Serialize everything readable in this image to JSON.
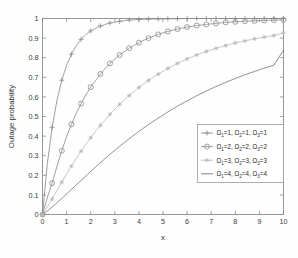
{
  "chart_data": {
    "type": "line",
    "title": "",
    "xlabel": "x",
    "ylabel": "Outage probability",
    "xlim": [
      0,
      10
    ],
    "ylim": [
      0,
      1
    ],
    "xticks": [
      "0",
      "1",
      "2",
      "3",
      "4",
      "5",
      "6",
      "7",
      "8",
      "9",
      "10"
    ],
    "yticks": [
      "0",
      "0.1",
      "0.2",
      "0.3",
      "0.4",
      "0.5",
      "0.6",
      "0.7",
      "0.8",
      "0.9",
      "1"
    ],
    "grid": false,
    "legend_position": "lower right",
    "x": [
      0,
      0.2,
      0.4,
      0.6,
      0.8,
      1.0,
      1.2,
      1.4,
      1.6,
      1.8,
      2.0,
      2.4,
      2.8,
      3.2,
      3.6,
      4.0,
      4.4,
      4.8,
      5.2,
      5.6,
      6.0,
      6.4,
      6.8,
      7.2,
      7.6,
      8.0,
      8.4,
      8.8,
      9.2,
      9.6,
      10.0
    ],
    "series": [
      {
        "name": "Ω₁=1, Ω₂=1, Ω₃=1",
        "omega1": 1,
        "omega2": 1,
        "omega3": 1,
        "marker": "plus",
        "color": "#8a8a8a",
        "marker_x": [
          0,
          0.4,
          0.8,
          1.2,
          1.6,
          2.0,
          2.4,
          2.8,
          3.2,
          3.6,
          4.0,
          4.4,
          4.8,
          5.2,
          5.6,
          6.0,
          6.4,
          6.8,
          7.2,
          7.6,
          8.0,
          8.4,
          8.8,
          9.2,
          9.6,
          10.0
        ],
        "values": [
          0.0,
          0.259,
          0.445,
          0.582,
          0.685,
          0.761,
          0.818,
          0.861,
          0.894,
          0.918,
          0.937,
          0.962,
          0.977,
          0.986,
          0.992,
          0.995,
          0.997,
          0.998,
          0.999,
          0.999,
          1.0,
          1.0,
          1.0,
          1.0,
          1.0,
          1.0,
          1.0,
          1.0,
          1.0,
          1.0,
          1.0
        ]
      },
      {
        "name": "Ω₁=2, Ω₂=2, Ω₃=2",
        "omega1": 2,
        "omega2": 2,
        "omega3": 2,
        "marker": "circle",
        "color": "#8a8a8a",
        "marker_x": [
          0,
          0.4,
          0.8,
          1.2,
          1.6,
          2.0,
          2.4,
          2.8,
          3.2,
          3.6,
          4.0,
          4.4,
          4.8,
          5.2,
          5.6,
          6.0,
          6.4,
          6.8,
          7.2,
          7.6,
          8.0,
          8.4,
          8.8,
          9.2,
          9.6,
          10.0
        ],
        "values": [
          0.0,
          0.086,
          0.16,
          0.245,
          0.325,
          0.398,
          0.46,
          0.516,
          0.566,
          0.61,
          0.65,
          0.717,
          0.771,
          0.814,
          0.849,
          0.877,
          0.9,
          0.919,
          0.934,
          0.946,
          0.956,
          0.964,
          0.97,
          0.975,
          0.98,
          0.983,
          0.986,
          0.988,
          0.99,
          0.992,
          0.993
        ]
      },
      {
        "name": "Ω₁=3, Ω₂=3, Ω₃=3",
        "omega1": 3,
        "omega2": 3,
        "omega3": 3,
        "marker": "star",
        "color": "#b6b6b6",
        "marker_x": [
          0,
          0.4,
          0.8,
          1.2,
          1.6,
          2.0,
          2.4,
          2.8,
          3.2,
          3.6,
          4.0,
          4.4,
          4.8,
          5.2,
          5.6,
          6.0,
          6.4,
          6.8,
          7.2,
          7.6,
          8.0,
          8.4,
          8.8,
          9.2,
          9.6,
          10.0
        ],
        "values": [
          0.0,
          0.04,
          0.08,
          0.122,
          0.165,
          0.207,
          0.247,
          0.286,
          0.323,
          0.358,
          0.392,
          0.455,
          0.512,
          0.562,
          0.607,
          0.648,
          0.684,
          0.716,
          0.745,
          0.771,
          0.794,
          0.814,
          0.832,
          0.848,
          0.862,
          0.875,
          0.886,
          0.896,
          0.905,
          0.913,
          0.927
        ]
      },
      {
        "name": "Ω₁=4, Ω₂=4, Ω₃=4",
        "omega1": 4,
        "omega2": 4,
        "omega3": 4,
        "marker": "none",
        "color": "#6e6e6e",
        "marker_x": [],
        "values": [
          0.0,
          0.018,
          0.038,
          0.06,
          0.082,
          0.105,
          0.128,
          0.151,
          0.174,
          0.197,
          0.22,
          0.264,
          0.307,
          0.348,
          0.387,
          0.424,
          0.459,
          0.492,
          0.523,
          0.553,
          0.58,
          0.606,
          0.63,
          0.653,
          0.674,
          0.694,
          0.713,
          0.73,
          0.747,
          0.762,
          0.838
        ]
      }
    ]
  },
  "legend": {
    "entries": [
      {
        "label_full": "Ω₁=1, Ω₂=1, Ω₃=1",
        "parts": [
          "Ω",
          "1",
          "=1, ",
          "Ω",
          "2",
          "=1, ",
          "Ω",
          "3",
          "=1"
        ]
      },
      {
        "label_full": "Ω₁=2, Ω₂=2, Ω₃=2",
        "parts": [
          "Ω",
          "1",
          "=2, ",
          "Ω",
          "2",
          "=2, ",
          "Ω",
          "3",
          "=2"
        ]
      },
      {
        "label_full": "Ω₁=3, Ω₂=3, Ω₃=3",
        "parts": [
          "Ω",
          "1",
          "=3, ",
          "Ω",
          "2",
          "=3, ",
          "Ω",
          "3",
          "=3"
        ]
      },
      {
        "label_full": "Ω₁=4, Ω₂=4, Ω₃=4",
        "parts": [
          "Ω",
          "1",
          "=4, ",
          "Ω",
          "2",
          "=4, ",
          "Ω",
          "3",
          "=4"
        ]
      }
    ]
  },
  "colors": {
    "axis": "#8c8c8c",
    "text": "#2e2e2e",
    "background": "#fefefe",
    "legend_border": "#9a9a9a"
  }
}
